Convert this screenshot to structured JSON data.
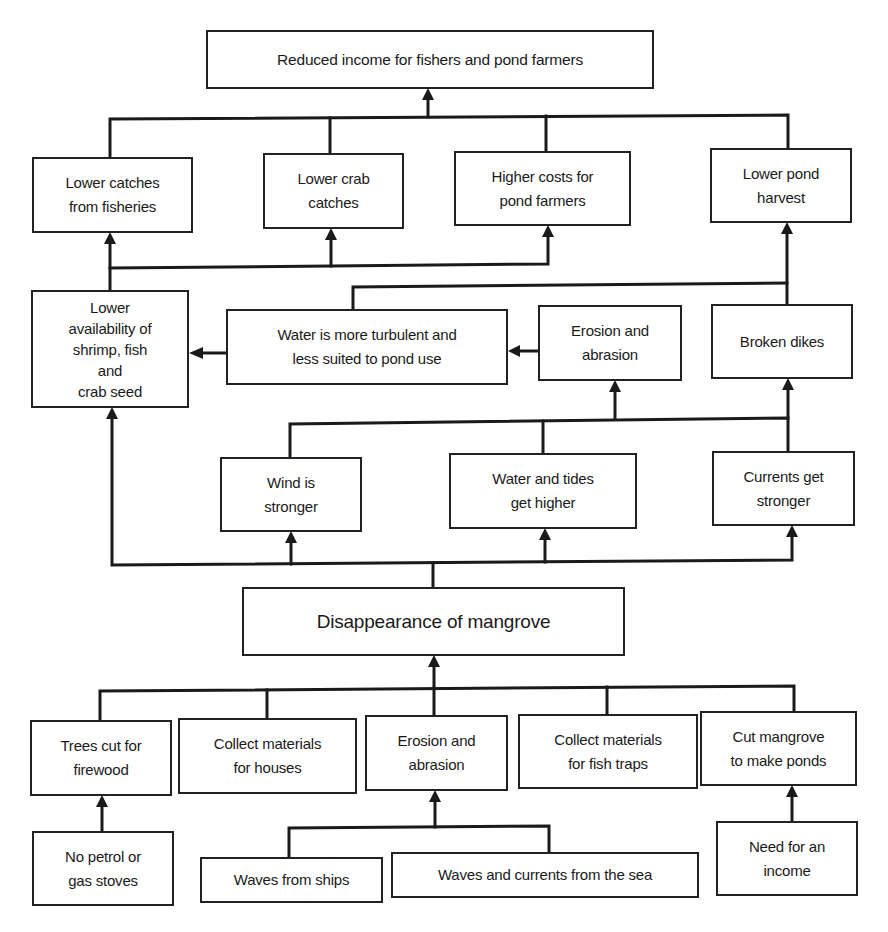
{
  "diagram": {
    "type": "problem-tree",
    "nodes": {
      "reduced_income": "Reduced income for fishers and pond farmers",
      "lower_catches": "Lower catches\nfrom fisheries",
      "lower_crab": "Lower crab\ncatches",
      "higher_costs": "Higher costs for\npond farmers",
      "lower_pond": "Lower pond\nharvest",
      "lower_availability": "Lower\navailability of\nshrimp, fish\nand\ncrab seed",
      "water_turbulent": "Water is more turbulent and\nless suited to pond use",
      "erosion_upper": "Erosion and\nabrasion",
      "broken_dikes": "Broken dikes",
      "wind_stronger": "Wind is\nstronger",
      "water_tides": "Water and tides\nget higher",
      "currents_stronger": "Currents get\nstronger",
      "disappearance": "Disappearance of mangrove",
      "trees_cut": "Trees cut for\nfirewood",
      "collect_houses": "Collect materials\nfor houses",
      "erosion_lower": "Erosion and\nabrasion",
      "collect_traps": "Collect materials\nfor fish traps",
      "cut_mangrove": "Cut mangrove\nto make ponds",
      "no_petrol": "No petrol or\ngas stoves",
      "waves_ships": "Waves from ships",
      "waves_sea": "Waves and currents from the sea",
      "need_income": "Need for an\nincome"
    },
    "edges": [
      [
        "lower_catches",
        "reduced_income"
      ],
      [
        "lower_crab",
        "reduced_income"
      ],
      [
        "higher_costs",
        "reduced_income"
      ],
      [
        "lower_pond",
        "reduced_income"
      ],
      [
        "lower_availability",
        "lower_catches"
      ],
      [
        "lower_availability",
        "lower_crab"
      ],
      [
        "lower_availability",
        "higher_costs"
      ],
      [
        "water_turbulent",
        "lower_pond"
      ],
      [
        "broken_dikes",
        "lower_pond"
      ],
      [
        "water_turbulent",
        "lower_availability"
      ],
      [
        "erosion_upper",
        "water_turbulent"
      ],
      [
        "wind_stronger",
        "erosion_upper"
      ],
      [
        "water_tides",
        "erosion_upper"
      ],
      [
        "currents_stronger",
        "erosion_upper"
      ],
      [
        "currents_stronger",
        "broken_dikes"
      ],
      [
        "disappearance",
        "lower_availability"
      ],
      [
        "disappearance",
        "wind_stronger"
      ],
      [
        "disappearance",
        "water_tides"
      ],
      [
        "disappearance",
        "currents_stronger"
      ],
      [
        "trees_cut",
        "disappearance"
      ],
      [
        "collect_houses",
        "disappearance"
      ],
      [
        "erosion_lower",
        "disappearance"
      ],
      [
        "collect_traps",
        "disappearance"
      ],
      [
        "cut_mangrove",
        "disappearance"
      ],
      [
        "no_petrol",
        "trees_cut"
      ],
      [
        "waves_ships",
        "erosion_lower"
      ],
      [
        "waves_sea",
        "erosion_lower"
      ],
      [
        "need_income",
        "cut_mangrove"
      ]
    ],
    "colors": {
      "line": "#1a1a1a",
      "box_border": "#222222",
      "background": "#ffffff"
    }
  }
}
